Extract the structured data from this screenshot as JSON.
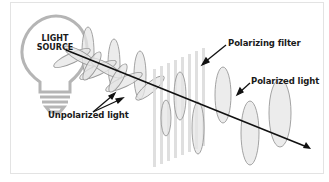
{
  "diagram": {
    "source": {
      "line1": "LIGHT",
      "line2": "SOURCE",
      "icon": "lightbulb-icon"
    },
    "labels": {
      "polarizing_filter": "Polarizing filter",
      "polarized_light": "Polarized light",
      "unpolarized_light": "Unpolarized light"
    },
    "colors": {
      "wave_fill": "#e6e6e6",
      "wave_stroke": "#9a9a9a",
      "filter_bars": "#dcdcdc",
      "axis": "#111111",
      "border": "#e3e3e3"
    }
  }
}
